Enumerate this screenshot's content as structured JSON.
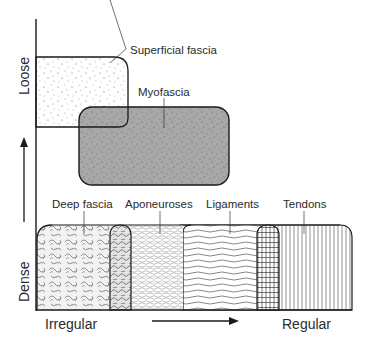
{
  "diagram": {
    "axes": {
      "y_top_label": "Loose",
      "y_bottom_label": "Dense",
      "x_left_label": "Irregular",
      "x_right_label": "Regular"
    },
    "loose_tissues": [
      {
        "id": "superficial",
        "label": "Superficial fascia",
        "fill": "#ffffff",
        "pattern": "sparse-dots"
      },
      {
        "id": "myofascia",
        "label": "Myofascia",
        "fill": "#a8a8a8",
        "pattern": "dense-dots"
      }
    ],
    "dense_tissues": [
      {
        "id": "deep-fascia",
        "label": "Deep fascia",
        "pattern": "curly-fibers"
      },
      {
        "id": "aponeuroses",
        "label": "Aponeuroses",
        "pattern": "crossed-waves"
      },
      {
        "id": "ligaments",
        "label": "Ligaments",
        "pattern": "horizontal-waves"
      },
      {
        "id": "tendons",
        "label": "Tendons",
        "pattern": "vertical-lines"
      }
    ],
    "colors": {
      "stroke": "#1a1a1a",
      "myofascia_fill": "#a8a8a8",
      "text": "#2a2a2a"
    }
  }
}
